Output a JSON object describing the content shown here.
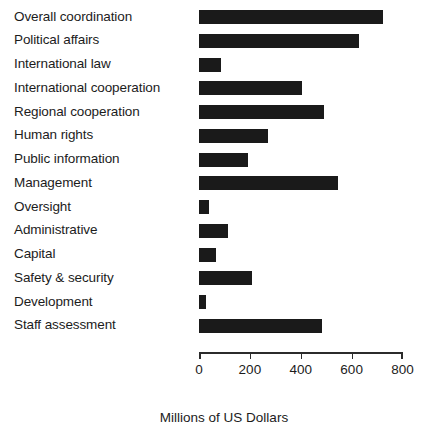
{
  "chart_data": {
    "type": "bar",
    "orientation": "horizontal",
    "title": "",
    "xlabel": "Millions of US Dollars",
    "ylabel": "",
    "xlim": [
      0,
      800
    ],
    "xticks": [
      0,
      200,
      400,
      600,
      800
    ],
    "xtick_labels": [
      "0",
      "200",
      "400",
      "600",
      "800"
    ],
    "grid": false,
    "legend": null,
    "bar_color": "#1a1a1a",
    "background_color": "#ffffff",
    "categories": [
      "Overall coordination",
      "Political affairs",
      "International law",
      "International cooperation",
      "Regional cooperation",
      "Human rights",
      "Public information",
      "Management",
      "Oversight",
      "Administrative",
      "Capital",
      "Safety & security",
      "Development",
      "Staff assessment"
    ],
    "values": [
      725,
      630,
      87,
      406,
      492,
      272,
      193,
      548,
      41,
      115,
      66,
      210,
      28,
      485
    ]
  }
}
